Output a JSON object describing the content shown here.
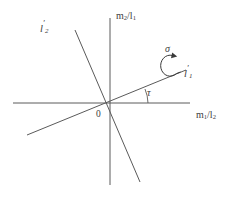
{
  "figure": {
    "background_color": "#ffffff",
    "line_color": "#5a5a5a",
    "text_color": "#3c3c3c",
    "width": 243,
    "height": 204
  },
  "axes": {
    "vertical": {
      "name": "vertical-axis",
      "label_main": "m",
      "label_sub1": "2",
      "label_slash": "/l",
      "label_sub2": "1",
      "label_full": "m2/l1",
      "x": 110,
      "y_top": 18,
      "y_bottom": 185
    },
    "horizontal": {
      "name": "horizontal-axis",
      "label_main": "m",
      "label_sub1": "1",
      "label_slash": "/l",
      "label_sub2": "2",
      "label_full": "m1/l2",
      "y": 103,
      "x_left": 13,
      "x_right": 190
    }
  },
  "origin": {
    "label": "0",
    "x": 110,
    "y": 103
  },
  "lines": [
    {
      "name": "line-l1-prime",
      "label_main": "l",
      "label_prime": "′",
      "label_sub": "1",
      "label_full": "l'1",
      "x1": 27,
      "y1": 135,
      "x2": 186,
      "y2": 70,
      "description": "inclined line through origin rising to the right at angle tau"
    },
    {
      "name": "line-l2-prime",
      "label_main": "l",
      "label_prime": "′",
      "label_sub": "2",
      "label_full": "l'2",
      "x1": 75,
      "y1": 30,
      "x2": 140,
      "y2": 182,
      "description": "steep line through origin descending to the right, perpendicular to l'1"
    }
  ],
  "annotations": {
    "angle": {
      "name": "angle-tau",
      "symbol": "τ",
      "description": "angle between positive horizontal axis and line l'1",
      "arc_radius": 36
    },
    "rotation": {
      "name": "rotation-sigma",
      "symbol": "σ",
      "description": "curved arrow indicating rotation about line l'1"
    }
  }
}
